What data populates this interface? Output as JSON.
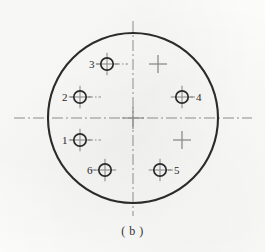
{
  "figure": {
    "caption": "( b )",
    "background_color": "#fcfcfb",
    "ink_color": "#2b2b2b",
    "centerline_color": "#8c8c8c",
    "type": "connector-pin-layout-diagram"
  },
  "outline": {
    "name": "connector-body-outline",
    "shape": "circle",
    "center_x": 133,
    "center_y": 118,
    "radius": 85,
    "stroke_width": 2.1,
    "color": "#2b2b2b"
  },
  "centerlines": {
    "style": "dash-dot",
    "color": "#8c8c8c",
    "horizontal": {
      "y": 118,
      "x_start": 14,
      "x_end": 252
    },
    "vertical": {
      "x": 133,
      "y_start": 21,
      "y_end": 216
    }
  },
  "center_mark": {
    "name": "center-crosshair",
    "x": 133,
    "y": 118,
    "arm": 11
  },
  "pins": [
    {
      "id": "pin-1",
      "label": "1",
      "cx": 80,
      "cy": 140,
      "r": 6.2,
      "has_circle": true,
      "label_side": "left",
      "label_x": 62,
      "label_y": 135
    },
    {
      "id": "pin-2",
      "label": "2",
      "cx": 80,
      "cy": 97,
      "r": 6.2,
      "has_circle": true,
      "label_side": "left",
      "label_x": 62,
      "label_y": 92
    },
    {
      "id": "pin-3",
      "label": "3",
      "cx": 107,
      "cy": 64,
      "r": 6.2,
      "has_circle": true,
      "label_side": "left",
      "label_x": 89,
      "label_y": 59
    },
    {
      "id": "pin-4",
      "label": "4",
      "cx": 182,
      "cy": 97,
      "r": 6.2,
      "has_circle": true,
      "label_side": "right",
      "label_x": 196,
      "label_y": 92
    },
    {
      "id": "pin-5",
      "label": "5",
      "cx": 160,
      "cy": 170,
      "r": 6.2,
      "has_circle": true,
      "label_side": "right",
      "label_x": 174,
      "label_y": 165
    },
    {
      "id": "pin-6",
      "label": "6",
      "cx": 105,
      "cy": 170,
      "r": 6.2,
      "has_circle": true,
      "label_side": "left",
      "label_x": 87,
      "label_y": 165
    }
  ],
  "empty_positions": [
    {
      "id": "position-mark-upper-right",
      "cx": 158,
      "cy": 64,
      "arm": 9
    },
    {
      "id": "position-mark-lower-right",
      "cx": 182,
      "cy": 140,
      "arm": 9
    }
  ],
  "leader_lines": [
    {
      "id": "leader-pin-1",
      "x1": 88,
      "y1": 140,
      "x2": 101,
      "y2": 140
    },
    {
      "id": "leader-pin-2",
      "x1": 88,
      "y1": 97,
      "x2": 101,
      "y2": 97
    },
    {
      "id": "leader-pin-3",
      "x1": 115,
      "y1": 64,
      "x2": 128,
      "y2": 64
    },
    {
      "id": "leader-pin-4",
      "x1": 190,
      "y1": 97,
      "x2": 196,
      "y2": 97
    },
    {
      "id": "leader-pin-5",
      "x1": 168,
      "y1": 170,
      "x2": 175,
      "y2": 170
    },
    {
      "id": "leader-pin-6",
      "x1": 96,
      "y1": 170,
      "x2": 89,
      "y2": 170
    },
    {
      "id": "leader-pin-3-label",
      "x1": 96,
      "y1": 64,
      "x2": 101,
      "y2": 64
    },
    {
      "id": "leader-pin-2-label",
      "x1": 70,
      "y1": 97,
      "x2": 74,
      "y2": 97
    },
    {
      "id": "leader-pin-1-label",
      "x1": 70,
      "y1": 140,
      "x2": 74,
      "y2": 140
    }
  ]
}
